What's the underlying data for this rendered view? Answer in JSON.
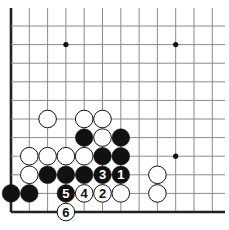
{
  "diagram": {
    "type": "go-board-fragment",
    "corner": "bottom-left",
    "colors": {
      "line": "#8a8a8a",
      "edge": "#222222",
      "black": "#111111",
      "white": "#ffffff",
      "star": "#111111"
    },
    "grid": {
      "cols": 12,
      "rows": 11,
      "x0": 11,
      "dx": 18.3,
      "y0": 212,
      "dy": 18.6
    },
    "star_points": [
      {
        "i": 3,
        "j": 9
      },
      {
        "i": 9,
        "j": 9
      },
      {
        "i": 9,
        "j": 3
      }
    ],
    "stones": [
      {
        "color": "white",
        "i": 2,
        "j": 5,
        "label": ""
      },
      {
        "color": "white",
        "i": 4,
        "j": 5,
        "label": ""
      },
      {
        "color": "white",
        "i": 5,
        "j": 5,
        "label": ""
      },
      {
        "color": "black",
        "i": 4,
        "j": 4,
        "label": ""
      },
      {
        "color": "white",
        "i": 5,
        "j": 4,
        "label": ""
      },
      {
        "color": "black",
        "i": 6,
        "j": 4,
        "label": ""
      },
      {
        "color": "white",
        "i": 1,
        "j": 3,
        "label": ""
      },
      {
        "color": "white",
        "i": 2,
        "j": 3,
        "label": ""
      },
      {
        "color": "white",
        "i": 3,
        "j": 3,
        "label": ""
      },
      {
        "color": "white",
        "i": 4,
        "j": 3,
        "label": ""
      },
      {
        "color": "black",
        "i": 5,
        "j": 3,
        "label": ""
      },
      {
        "color": "black",
        "i": 6,
        "j": 3,
        "label": ""
      },
      {
        "color": "white",
        "i": 1,
        "j": 2,
        "label": ""
      },
      {
        "color": "black",
        "i": 2,
        "j": 2,
        "label": ""
      },
      {
        "color": "black",
        "i": 3,
        "j": 2,
        "label": ""
      },
      {
        "color": "black",
        "i": 4,
        "j": 2,
        "label": ""
      },
      {
        "color": "black",
        "i": 5,
        "j": 2,
        "label": "3"
      },
      {
        "color": "black",
        "i": 6,
        "j": 2,
        "label": "1"
      },
      {
        "color": "white",
        "i": 8,
        "j": 2,
        "label": ""
      },
      {
        "color": "black",
        "i": 0,
        "j": 1,
        "label": ""
      },
      {
        "color": "black",
        "i": 1,
        "j": 1,
        "label": ""
      },
      {
        "color": "black",
        "i": 3,
        "j": 1,
        "label": "5"
      },
      {
        "color": "white",
        "i": 4,
        "j": 1,
        "label": "4"
      },
      {
        "color": "white",
        "i": 5,
        "j": 1,
        "label": "2"
      },
      {
        "color": "white",
        "i": 6,
        "j": 1,
        "label": ""
      },
      {
        "color": "white",
        "i": 8,
        "j": 1,
        "label": ""
      },
      {
        "color": "white",
        "i": 3,
        "j": 0,
        "label": "6"
      }
    ]
  }
}
